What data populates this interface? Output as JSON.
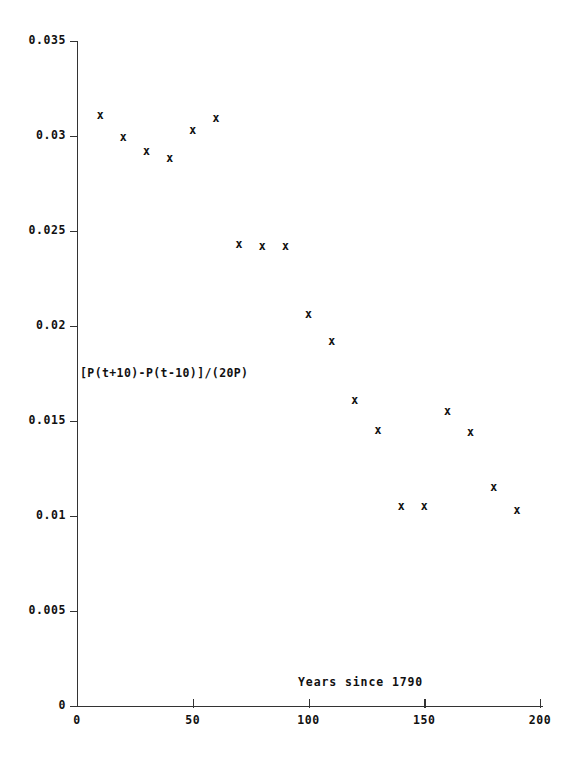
{
  "chart_data": {
    "type": "scatter",
    "title": "",
    "xlabel": "Years since 1790",
    "ylabel": "[P(t+10)-P(t-10)]/(20P)",
    "xlim": [
      0,
      205
    ],
    "ylim": [
      0,
      0.035
    ],
    "grid": false,
    "legend": null,
    "marker": "x",
    "marker_color": "#111111",
    "xticks": [
      "0",
      "50",
      "100",
      "150",
      "200"
    ],
    "xtick_values": [
      0,
      50,
      100,
      150,
      200
    ],
    "yticks": [
      "0",
      "0.005",
      "0.01",
      "0.015",
      "0.02",
      "0.025",
      "0.03",
      "0.035"
    ],
    "ytick_values": [
      0,
      0.005,
      0.01,
      0.015,
      0.02,
      0.025,
      0.03,
      0.035
    ],
    "x": [
      10,
      20,
      30,
      40,
      50,
      60,
      70,
      80,
      90,
      100,
      110,
      120,
      130,
      140,
      150,
      160,
      170,
      180,
      190
    ],
    "y": [
      0.0311,
      0.0299,
      0.0292,
      0.0288,
      0.0303,
      0.0309,
      0.0243,
      0.0242,
      0.0242,
      0.0206,
      0.0192,
      0.0161,
      0.0145,
      0.0105,
      0.0105,
      0.0155,
      0.0144,
      0.0115,
      0.0103
    ],
    "points": [
      {
        "x": 10,
        "y": 0.0311
      },
      {
        "x": 20,
        "y": 0.0299
      },
      {
        "x": 30,
        "y": 0.0292
      },
      {
        "x": 40,
        "y": 0.0288
      },
      {
        "x": 50,
        "y": 0.0303
      },
      {
        "x": 60,
        "y": 0.0309
      },
      {
        "x": 70,
        "y": 0.0243
      },
      {
        "x": 80,
        "y": 0.0242
      },
      {
        "x": 90,
        "y": 0.0242
      },
      {
        "x": 100,
        "y": 0.0206
      },
      {
        "x": 110,
        "y": 0.0192
      },
      {
        "x": 120,
        "y": 0.0161
      },
      {
        "x": 130,
        "y": 0.0145
      },
      {
        "x": 140,
        "y": 0.0105
      },
      {
        "x": 150,
        "y": 0.0105
      },
      {
        "x": 160,
        "y": 0.0155
      },
      {
        "x": 170,
        "y": 0.0144
      },
      {
        "x": 180,
        "y": 0.0115
      },
      {
        "x": 190,
        "y": 0.0103
      }
    ]
  }
}
